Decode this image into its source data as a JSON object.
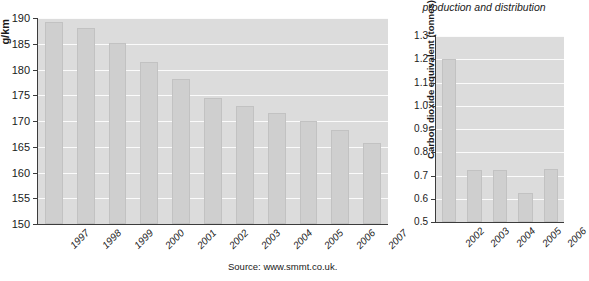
{
  "source_note": "Source: www.smmt.co.uk.",
  "left": {
    "y_axis_title": "g/km",
    "chart_data": {
      "type": "bar",
      "title": "",
      "subtitle": "",
      "xlabel": "",
      "ylabel": "g/km",
      "ylim": [
        150,
        190
      ],
      "ytick_step": 5,
      "ytick_labels": [
        "150",
        "155",
        "160",
        "165",
        "170",
        "175",
        "180",
        "185",
        "190"
      ],
      "grid": true,
      "legend": "none",
      "categories": [
        "1997",
        "1998",
        "1999",
        "2000",
        "2001",
        "2002",
        "2003",
        "2004",
        "2005",
        "2006",
        "2007"
      ],
      "values": [
        189.3,
        188.1,
        185.2,
        181.4,
        178.1,
        174.5,
        173.0,
        171.5,
        170.0,
        168.3,
        165.8
      ],
      "bar_color": "#cfcfcf",
      "plot_background": "#dcdcdc",
      "gridline_color": "#fbfbfb"
    }
  },
  "right": {
    "title": "production and distribution",
    "y_axis_title": "Carbon dioxide equivalent (tonnes) per vehicle produced (VM)",
    "chart_data": {
      "type": "bar",
      "title": "production and distribution",
      "subtitle": "",
      "xlabel": "",
      "ylabel": "Carbon dioxide equivalent (tonnes) per vehicle produced (VM)",
      "ylim": [
        0.5,
        1.3
      ],
      "ytick_step": 0.1,
      "ytick_labels": [
        "0.5",
        "0.6",
        "0.7",
        "0.8",
        "0.9",
        "1.0",
        "1.1",
        "1.2",
        "1.3"
      ],
      "grid": true,
      "legend": "none",
      "categories": [
        "2002",
        "2003",
        "2004",
        "2005",
        "2006"
      ],
      "values": [
        1.2,
        0.725,
        0.722,
        0.625,
        0.727
      ],
      "bar_color": "#cfcfcf",
      "plot_background": "#dcdcdc",
      "gridline_color": "#fbfbfb"
    }
  }
}
